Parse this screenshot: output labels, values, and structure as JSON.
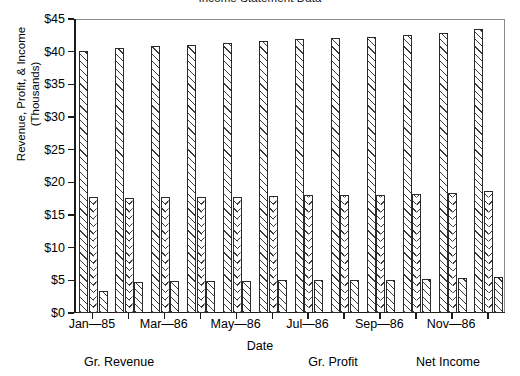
{
  "chart_data": {
    "type": "bar",
    "title": "Income Statement Data",
    "xlabel": "Date",
    "ylabel": "Revenue, Profit, & Income",
    "ylabel_line2": "(Thousands)",
    "ylim": [
      0,
      45
    ],
    "ytick_values": [
      0,
      5,
      10,
      15,
      20,
      25,
      30,
      35,
      40,
      45
    ],
    "ytick_labels": [
      "$0",
      "$5",
      "$10",
      "$15",
      "$20",
      "$25",
      "$30",
      "$35",
      "$40",
      "$45"
    ],
    "grid": false,
    "legend_position": "below-axis-inline",
    "categories": [
      "Jan—85",
      "Feb—86",
      "Mar—86",
      "Apr—86",
      "May—86",
      "Jun—86",
      "Jul—86",
      "Aug—86",
      "Sep—86",
      "Oct—86",
      "Nov—86",
      "Dec—86"
    ],
    "xtick_labels_shown": [
      "Jan—85",
      "",
      "Mar—86",
      "",
      "May—86",
      "",
      "Jul—86",
      "",
      "Sep—86",
      "",
      "Nov—86",
      ""
    ],
    "series": [
      {
        "name": "Gr. Revenue",
        "pattern": "diagonal-hatch",
        "values": [
          40.1,
          40.5,
          40.8,
          41.0,
          41.4,
          41.7,
          42.0,
          42.1,
          42.3,
          42.6,
          42.9,
          43.4
        ]
      },
      {
        "name": "Gr. Profit",
        "pattern": "chevron-hatch",
        "values": [
          17.8,
          17.6,
          17.8,
          17.8,
          17.8,
          17.9,
          18.0,
          18.1,
          18.1,
          18.2,
          18.4,
          18.6
        ]
      },
      {
        "name": "Net Income",
        "pattern": "diagonal-hatch",
        "values": [
          3.4,
          4.8,
          4.9,
          4.9,
          4.9,
          5.0,
          5.0,
          5.1,
          5.1,
          5.2,
          5.4,
          5.5
        ]
      }
    ]
  },
  "legend": {
    "items": [
      {
        "label": "Gr. Revenue"
      },
      {
        "label": "Gr. Profit"
      },
      {
        "label": "Net Income"
      }
    ]
  }
}
